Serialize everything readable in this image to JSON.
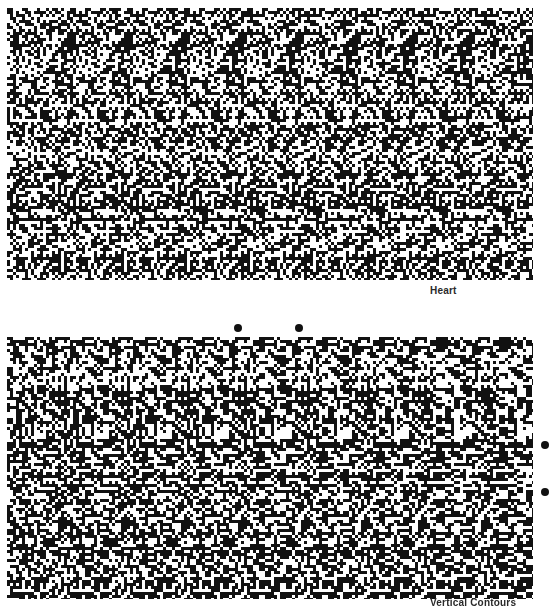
{
  "page": {
    "type": "scanned-book-page",
    "background_color": "#ffffff",
    "ink_color": "#111111"
  },
  "figures": [
    {
      "id": "heart",
      "kind": "random-dot autostereogram",
      "caption": "Heart",
      "hidden_shape": "heart"
    },
    {
      "id": "vertical-contours",
      "kind": "random-dot autostereogram",
      "caption": "Vertical Contours",
      "hidden_shape": "vertical contours"
    }
  ],
  "fusion_aids": {
    "top_pair_count": 2,
    "side_pair_count": 2,
    "icon": "filled-circle-dot"
  }
}
